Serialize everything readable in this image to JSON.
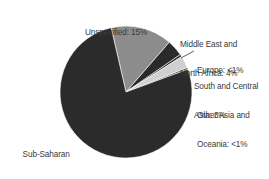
{
  "chart_data": {
    "type": "pie",
    "title": "",
    "start_angle_deg": -13,
    "direction": "clockwise",
    "slices": [
      {
        "label": "Unspecified",
        "display": "Unspecified: 15%",
        "value": 15,
        "color": "#8c8c8c"
      },
      {
        "label": "Middle East and North Africa",
        "display": "Middle East and North Africa: 4%",
        "value": 4,
        "color": "#2a2a2a"
      },
      {
        "label": "Europe",
        "display": "Europe: <1%",
        "value": 0.6,
        "color": "#2a2a2a"
      },
      {
        "label": "South and Central Asia",
        "display": "South and Central Asia: 3%",
        "value": 3,
        "color": "#d0d0d0"
      },
      {
        "label": "Other Asia and Oceania",
        "display": "Other Asia and Oceania: <1%",
        "value": 0.4,
        "color": "#2a2a2a"
      },
      {
        "label": "Sub-Saharan Africa",
        "display": "Sub-Saharan Africa: 77%",
        "value": 77,
        "color": "#2b2b2b"
      }
    ],
    "legend": "none (direct labels)"
  },
  "labels": {
    "unspecified": [
      "Unspecified: 15%"
    ],
    "mena": [
      "Middle East and",
      "North Africa: 4%"
    ],
    "europe": [
      "Europe: <1%"
    ],
    "sca": [
      "South and Central",
      "Asia: 3%"
    ],
    "oao": [
      "Other Asia and",
      "Oceania: <1%"
    ],
    "ssa": [
      "Sub-Saharan",
      "Africa: 77%"
    ]
  },
  "geometry": {
    "cx": 126,
    "cy": 92,
    "r": 66
  }
}
